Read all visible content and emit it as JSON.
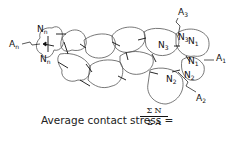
{
  "diagram": {
    "labels": {
      "An": "A",
      "An_sub": "n",
      "A1": "A",
      "A1_sub": "1",
      "A2": "A",
      "A2_sub": "2",
      "A3": "A",
      "A3_sub": "3",
      "Nn_top": "N",
      "Nn_top_sub": "n",
      "Nn_bottom": "N",
      "Nn_bottom_sub": "n",
      "N3_left": "N",
      "N3_left_sub": "3",
      "N3_right": "N",
      "N3_right_sub": "3",
      "N1_top": "N",
      "N1_top_sub": "1",
      "N1_right": "N",
      "N1_right_sub": "1",
      "N2_right": "N",
      "N2_right_sub": "2",
      "N2_bottom": "N",
      "N2_bottom_sub": "2"
    },
    "caption": {
      "text": "Average contact stress =",
      "numerator": "Σ N",
      "denominator": "Σ A",
      "sum_upper": "n",
      "sum_lower": "1"
    }
  }
}
